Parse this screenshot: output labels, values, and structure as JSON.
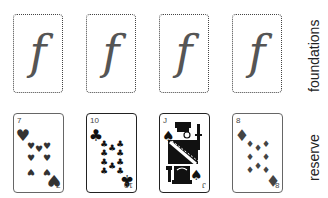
{
  "labels": {
    "foundations": "foundations",
    "reserve": "reserve"
  },
  "foundations": [
    {
      "glyph": "f",
      "state": "empty"
    },
    {
      "glyph": "f",
      "state": "empty"
    },
    {
      "glyph": "f",
      "state": "empty"
    },
    {
      "glyph": "f",
      "state": "empty"
    }
  ],
  "reserve": [
    {
      "rank": "7",
      "suit": "hearts",
      "suit_symbol": "♥",
      "color": "#333333"
    },
    {
      "rank": "10",
      "suit": "clubs",
      "suit_symbol": "♣",
      "color": "#111111"
    },
    {
      "rank": "J",
      "suit": "spades",
      "suit_symbol": "♠",
      "color": "#111111"
    },
    {
      "rank": "8",
      "suit": "diamonds",
      "suit_symbol": "♦",
      "color": "#444444"
    }
  ]
}
